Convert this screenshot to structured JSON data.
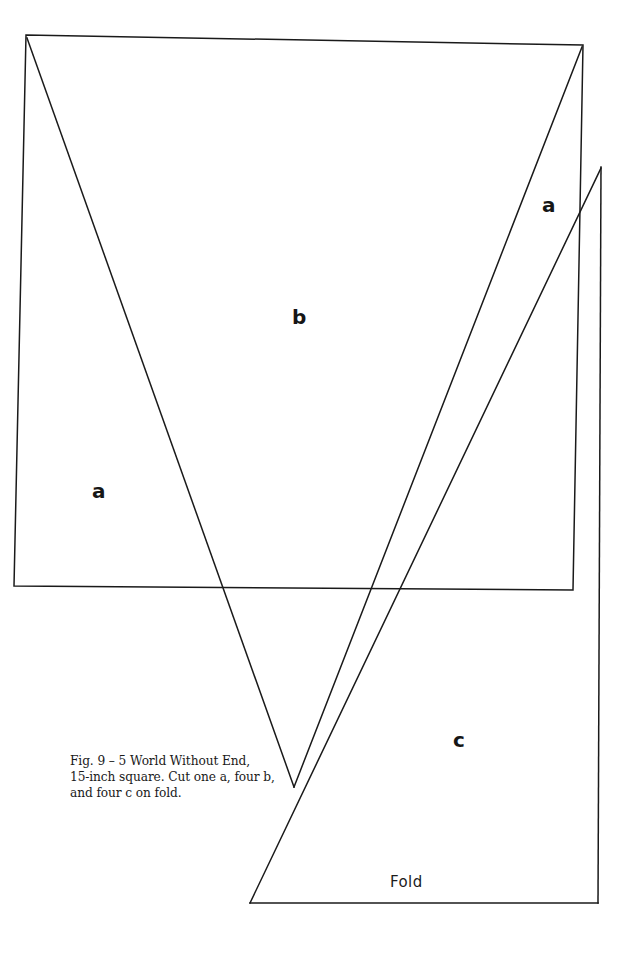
{
  "figure": {
    "caption_lines": [
      "Fig. 9 – 5 World Without End,",
      "15-inch square. Cut one a, four b,",
      "and four c on fold."
    ],
    "caption_full": "Fig. 9 – 5 World Without End, 15-inch square. Cut one a, four b, and four c on fold.",
    "figure_number": "Fig. 9 – 5",
    "figure_title": "World Without End",
    "block_size": "15-inch square",
    "cutting_instructions": "Cut one a, four b, and four c on fold.",
    "line_color": "#1a1a1a",
    "background_color": "#ffffff",
    "stroke_width": 1.5
  },
  "labels": {
    "piece_a_left": "a",
    "piece_b_top": "b",
    "piece_a_right": "a",
    "piece_c_bottom": "c",
    "fold": "Fold"
  },
  "pieces": [
    {
      "id": "a",
      "label": "a",
      "quantity": "one",
      "note": "Cut one a"
    },
    {
      "id": "b",
      "label": "b",
      "quantity": "four",
      "note": "four b"
    },
    {
      "id": "c",
      "label": "c",
      "quantity": "four",
      "note": "four c on fold"
    }
  ],
  "geometry": {
    "square": {
      "top_left": [
        26,
        35
      ],
      "top_right": [
        583,
        45
      ],
      "bottom_right": [
        573,
        590
      ],
      "bottom_left": [
        14,
        586
      ]
    },
    "right_panel": {
      "top": [
        601,
        167
      ],
      "bottom": [
        598,
        903
      ]
    },
    "fold_panel": {
      "bottom_left": [
        250,
        903
      ],
      "bottom_right": [
        598,
        903
      ]
    },
    "v_vertex": [
      294,
      787
    ],
    "diagonals": [
      {
        "name": "top-left-to-v",
        "from": [
          27,
          38
        ],
        "to": [
          294,
          787
        ]
      },
      {
        "name": "top-right-to-v",
        "from": [
          582,
          47
        ],
        "to": [
          294,
          787
        ]
      },
      {
        "name": "fold-corner-to-right-panel",
        "from": [
          250,
          903
        ],
        "to": [
          601,
          168
        ]
      }
    ]
  }
}
